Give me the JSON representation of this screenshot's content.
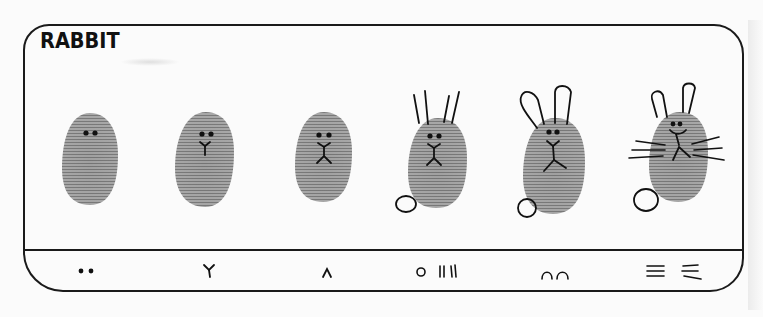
{
  "title": "RABBIT",
  "colors": {
    "ink": "#111111",
    "thumbprint": "#9a9a9a",
    "thumbprint_dark": "#7d7d7d",
    "paper": "#fbfbfb"
  },
  "steps": [
    {
      "index": 1,
      "features": [
        "eyes"
      ],
      "legend_glyph": "••",
      "legend_icon": "two-dots-icon"
    },
    {
      "index": 2,
      "features": [
        "eyes",
        "nose-y"
      ],
      "legend_glyph": "Y",
      "legend_icon": "y-nose-icon"
    },
    {
      "index": 3,
      "features": [
        "eyes",
        "nose-y",
        "mouth-legs"
      ],
      "legend_glyph": "∧",
      "legend_icon": "caret-mouth-icon"
    },
    {
      "index": 4,
      "features": [
        "eyes",
        "nose-y",
        "mouth-legs",
        "ear-lines",
        "tail"
      ],
      "legend_glyph": "O II II",
      "legend_icon": "tail-and-ears-icon"
    },
    {
      "index": 5,
      "features": [
        "eyes",
        "nose-y",
        "mouth-legs",
        "rounded-ears",
        "tail"
      ],
      "legend_glyph": "∩∩",
      "legend_icon": "ear-tops-icon"
    },
    {
      "index": 6,
      "features": [
        "eyes",
        "smile",
        "nose-y",
        "mouth-legs",
        "rounded-ears",
        "whiskers",
        "tail"
      ],
      "legend_glyph": "≡ ≡",
      "legend_icon": "whiskers-icon"
    }
  ]
}
